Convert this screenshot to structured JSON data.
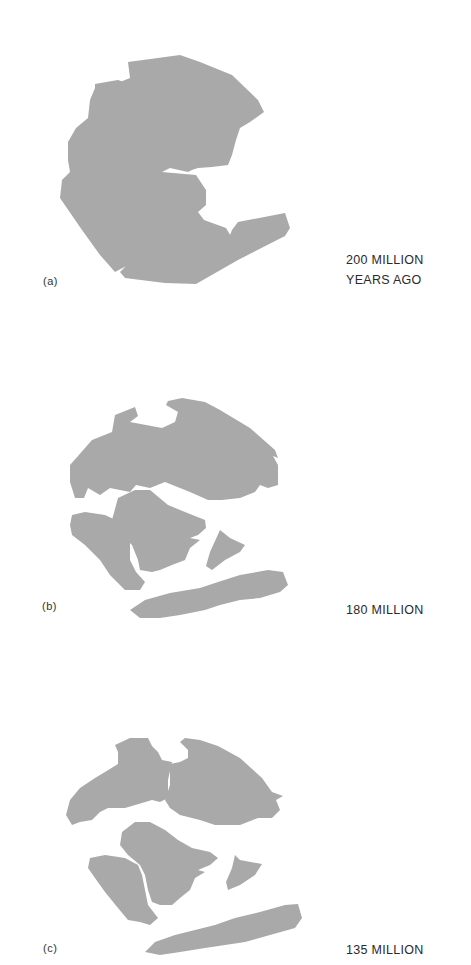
{
  "figure": {
    "land_color": "#a9a9a9",
    "background_color": "#ffffff",
    "panels": [
      {
        "letter": "(a)",
        "age_line1": "200 MILLION",
        "age_line2": "YEARS AGO"
      },
      {
        "letter": "(b)",
        "age_line1": "180 MILLION",
        "age_line2": ""
      },
      {
        "letter": "(c)",
        "age_line1": "135 MILLION",
        "age_line2": ""
      }
    ]
  }
}
